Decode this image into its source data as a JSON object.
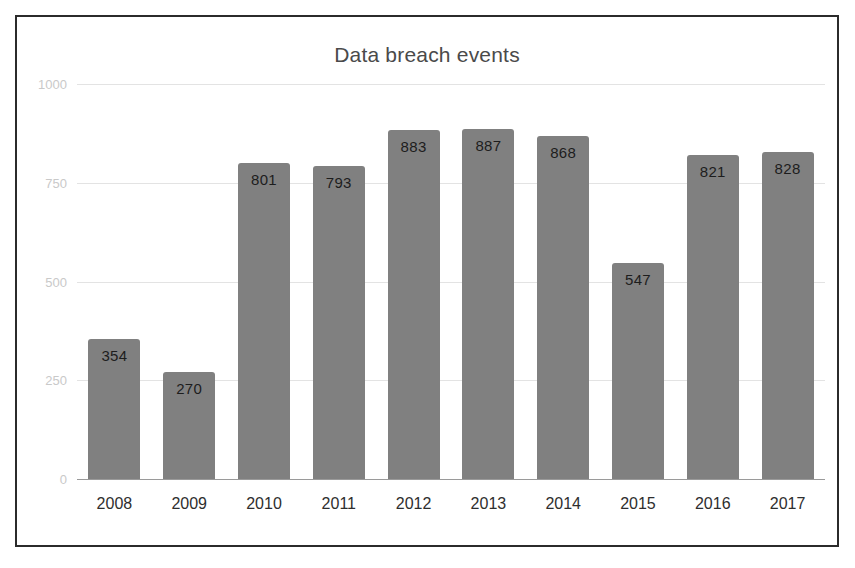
{
  "chart_data": {
    "type": "bar",
    "title": "Data breach events",
    "xlabel": "",
    "ylabel": "",
    "categories": [
      "2008",
      "2009",
      "2010",
      "2011",
      "2012",
      "2013",
      "2014",
      "2015",
      "2016",
      "2017"
    ],
    "values": [
      354,
      270,
      801,
      793,
      883,
      887,
      868,
      547,
      821,
      828
    ],
    "value_labels": [
      "354",
      "270",
      "801",
      "793",
      "883",
      "887",
      "868",
      "547",
      "821",
      "828"
    ],
    "ylim": [
      0,
      1000
    ],
    "yticks": [
      1000,
      750,
      500,
      250,
      0
    ],
    "ytick_labels": [
      "1000",
      "750",
      "500",
      "250",
      "0"
    ],
    "grid": true,
    "legend": false,
    "colors": {
      "bar": "#808080",
      "gridline": "#e3e3e3",
      "baseline": "#9a9a9a",
      "title": "#4a4a4a",
      "ytick": "#c9c9c9",
      "xtick": "#2e2e2e",
      "value_label": "#1d1d1d",
      "frame_border": "#2b2b2b",
      "background": "#ffffff"
    }
  }
}
